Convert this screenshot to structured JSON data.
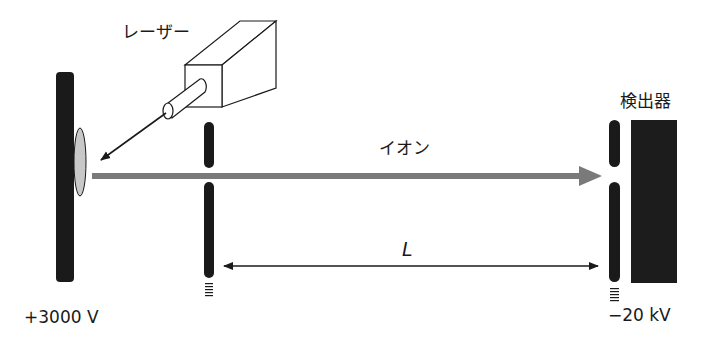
{
  "diagram": {
    "labels": {
      "laser": "レーザー",
      "ion": "イオン",
      "detector": "検出器",
      "length": "L",
      "sample_voltage": "+3000 V",
      "grid_voltage": "−20 kV"
    },
    "colors": {
      "plate": "#1a1a1a",
      "ion_beam": "#7a7a7a",
      "sample_spot": "#c8c8c8",
      "detector": "#1c1c1c",
      "line": "#1a1a1a"
    }
  }
}
